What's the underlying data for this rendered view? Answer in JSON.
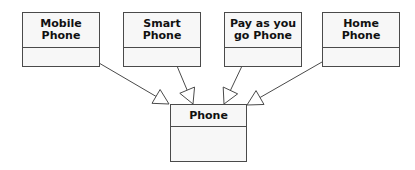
{
  "diagram": {
    "type": "uml-class-inheritance",
    "stroke_color": "#4a4a4a",
    "fill_color": "#f7f7f7",
    "parent": {
      "id": "phone",
      "label": "Phone",
      "box": {
        "x": 170,
        "y": 104,
        "w": 77,
        "h": 58,
        "header_h": 22
      }
    },
    "children": [
      {
        "id": "mobile-phone",
        "label": "Mobile\nPhone",
        "box": {
          "x": 22,
          "y": 12,
          "w": 78,
          "h": 55,
          "header_h": 35
        }
      },
      {
        "id": "smart-phone",
        "label": "Smart\nPhone",
        "box": {
          "x": 123,
          "y": 12,
          "w": 78,
          "h": 55,
          "header_h": 35
        }
      },
      {
        "id": "pay-as-you-go-phone",
        "label": "Pay as you\ngo Phone",
        "box": {
          "x": 224,
          "y": 12,
          "w": 78,
          "h": 55,
          "header_h": 35
        }
      },
      {
        "id": "home-phone",
        "label": "Home\nPhone",
        "box": {
          "x": 322,
          "y": 12,
          "w": 78,
          "h": 55,
          "header_h": 35
        }
      }
    ],
    "edges": [
      {
        "from": "mobile-phone",
        "to": "phone",
        "relation": "generalization",
        "start": [
          99,
          63
        ],
        "tip": [
          169,
          104
        ]
      },
      {
        "from": "smart-phone",
        "to": "phone",
        "relation": "generalization",
        "start": [
          177,
          66
        ],
        "tip": [
          193,
          104
        ]
      },
      {
        "from": "pay-as-you-go-phone",
        "to": "phone",
        "relation": "generalization",
        "start": [
          242,
          66
        ],
        "tip": [
          224,
          104
        ]
      },
      {
        "from": "home-phone",
        "to": "phone",
        "relation": "generalization",
        "start": [
          322,
          62
        ],
        "tip": [
          247,
          105
        ]
      }
    ]
  }
}
